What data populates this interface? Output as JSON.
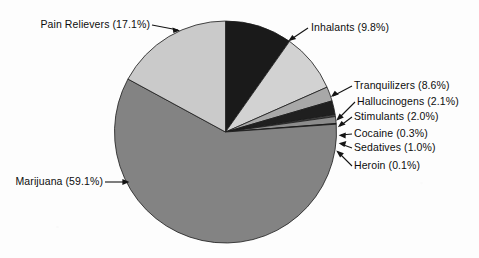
{
  "chart_data": {
    "type": "pie",
    "title": "",
    "subtitle": "",
    "xlabel": "",
    "ylabel": "",
    "legend_position": "none",
    "grid": false,
    "units": "percent",
    "start_angle_deg": 0,
    "direction": "clockwise",
    "categories": [
      "Inhalants",
      "Tranquilizers",
      "Hallucinogens",
      "Stimulants",
      "Cocaine",
      "Sedatives",
      "Heroin",
      "Marijuana",
      "Pain Relievers"
    ],
    "values": [
      9.8,
      8.6,
      2.1,
      2.0,
      0.3,
      1.0,
      0.1,
      59.1,
      17.1
    ],
    "colors": [
      "#1a1a1a",
      "#d2d2d2",
      "#a8a8a8",
      "#1f1f1f",
      "#4a4a4a",
      "#8c8c8c",
      "#2b2b2b",
      "#838383",
      "#cacaca"
    ],
    "slices": [
      {
        "name": "Inhalants",
        "value": 9.8,
        "label": "Inhalants (9.8%)",
        "color": "#1a1a1a"
      },
      {
        "name": "Tranquilizers",
        "value": 8.6,
        "label": "Tranquilizers (8.6%)",
        "color": "#d2d2d2"
      },
      {
        "name": "Hallucinogens",
        "value": 2.1,
        "label": "Hallucinogens (2.1%)",
        "color": "#a8a8a8"
      },
      {
        "name": "Stimulants",
        "value": 2.0,
        "label": "Stimulants (2.0%)",
        "color": "#1f1f1f"
      },
      {
        "name": "Cocaine",
        "value": 0.3,
        "label": "Cocaine (0.3%)",
        "color": "#4a4a4a"
      },
      {
        "name": "Sedatives",
        "value": 1.0,
        "label": "Sedatives (1.0%)",
        "color": "#8c8c8c"
      },
      {
        "name": "Heroin",
        "value": 0.1,
        "label": "Heroin (0.1%)",
        "color": "#2b2b2b"
      },
      {
        "name": "Marijuana",
        "value": 59.1,
        "label": "Marijuana (59.1%)",
        "color": "#838383"
      },
      {
        "name": "Pain Relievers",
        "value": 17.1,
        "label": "Pain Relievers (17.1%)",
        "color": "#cacaca"
      }
    ]
  },
  "labels": {
    "pain_relievers": "Pain Relievers (17.1%)",
    "inhalants": "Inhalants (9.8%)",
    "tranquilizers": "Tranquilizers (8.6%)",
    "hallucinogens": "Hallucinogens (2.1%)",
    "stimulants": "Stimulants (2.0%)",
    "cocaine": "Cocaine (0.3%)",
    "sedatives": "Sedatives (1.0%)",
    "heroin": "Heroin (0.1%)",
    "marijuana": "Marijuana (59.1%)"
  },
  "style": {
    "background": "#fdfdfd",
    "outline": "#1a1a1a",
    "text": "#0d0d0d"
  }
}
